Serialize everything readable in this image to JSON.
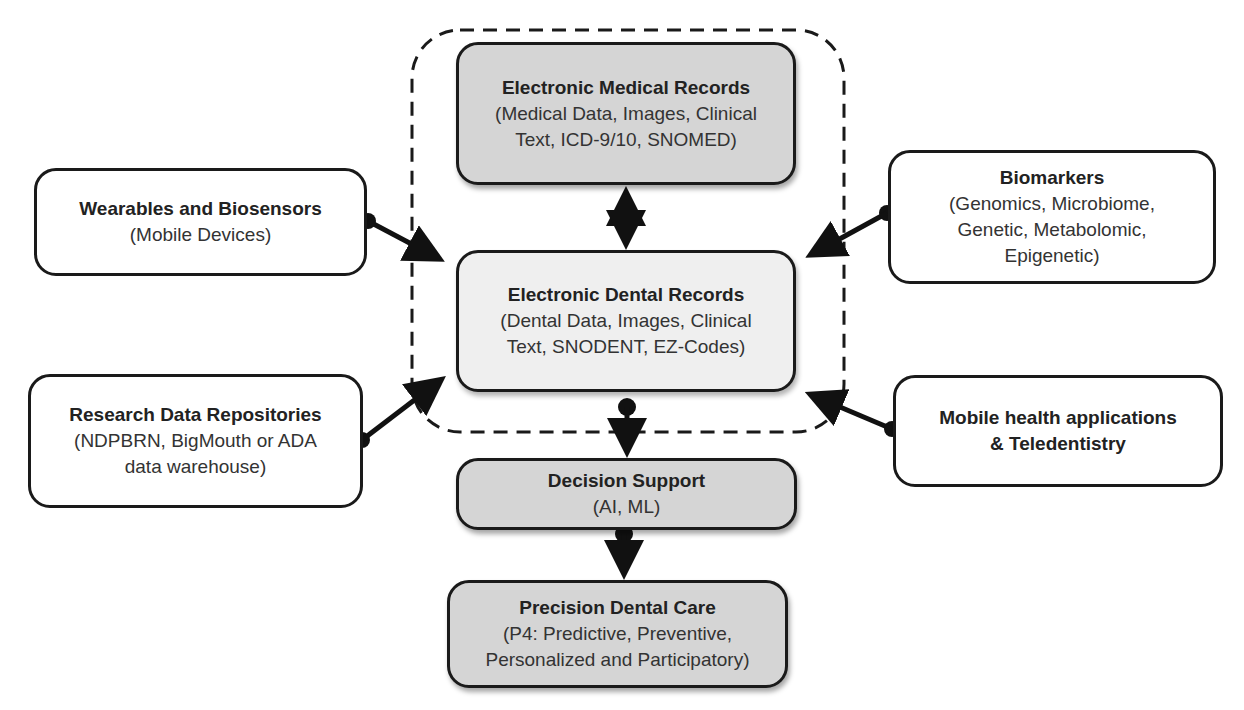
{
  "diagram": {
    "central_group": {
      "emr": {
        "title": "Electronic Medical Records",
        "subtitle": "(Medical Data, Images, Clinical\nText, ICD-9/10, SNOMED)"
      },
      "edr": {
        "title": "Electronic Dental Records",
        "subtitle": "(Dental Data, Images, Clinical\nText, SNODENT, EZ-Codes)"
      }
    },
    "inputs": {
      "wearables": {
        "title": "Wearables and Biosensors",
        "subtitle": "(Mobile Devices)"
      },
      "research": {
        "title": "Research Data Repositories",
        "subtitle": "(NDPBRN, BigMouth or ADA\ndata warehouse)"
      },
      "biomarkers": {
        "title": "Biomarkers",
        "subtitle": "(Genomics, Microbiome,\nGenetic, Metabolomic,\nEpigenetic)"
      },
      "mobile_health": {
        "title": "Mobile health applications\n& Teledentistry"
      }
    },
    "outputs": {
      "decision_support": {
        "title": "Decision Support",
        "subtitle": "(AI, ML)"
      },
      "precision_care": {
        "title": "Precision Dental Care",
        "subtitle": "(P4: Predictive, Preventive,\nPersonalized and Participatory)"
      }
    },
    "colors": {
      "dark_box_fill": "#d5d5d5",
      "light_box_fill": "#efefef",
      "stroke": "#1a1a1a"
    }
  }
}
